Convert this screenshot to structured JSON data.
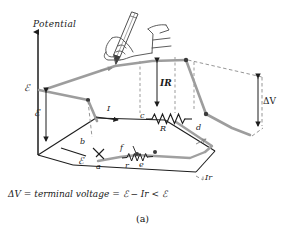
{
  "figure": {
    "caption": "(a)",
    "equation": "ΔV = terminal voltage = ℰ − Ir < ℰ",
    "axis_label": "Potential",
    "annotations": {
      "emf_axis": "ℰ",
      "emf_rise": "ℰ",
      "emf_source": "ℰ",
      "ir_drop": "IR",
      "terminal_voltage": "ΔV",
      "internal_drop": "Ir",
      "current": "I",
      "external_resistor": "R",
      "internal_resistor": "r"
    },
    "nodes": {
      "a": "a",
      "b": "b",
      "c": "c",
      "d": "d",
      "e": "e",
      "f": "f"
    },
    "icons": {
      "hand": "hand-with-pencil-icon",
      "pencil": "pencil-icon",
      "resistor_external": "resistor-coil-icon",
      "resistor_internal": "resistor-coil-icon",
      "battery": "battery-symbol-icon",
      "axis_arrow": "up-arrow-icon"
    },
    "colors": {
      "potential_curve": "#9a9a9a",
      "base_lines": "#1d1d1d",
      "dashed_lines": "#8a8a8a",
      "text": "#1a1a1a",
      "background": "#ffffff"
    }
  }
}
